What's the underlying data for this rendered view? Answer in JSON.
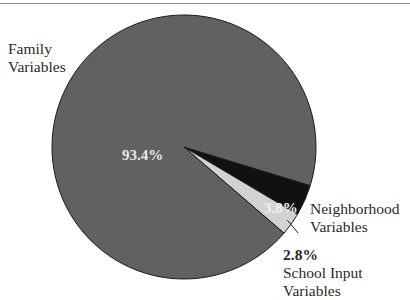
{
  "chart_data": {
    "type": "pie",
    "title": "",
    "categories": [
      "Family Variables",
      "Neighborhood Variables",
      "School Input Variables"
    ],
    "values": [
      93.4,
      3.8,
      2.8
    ],
    "unit": "%",
    "colors": [
      "#616161",
      "#111111",
      "#d2d2d2"
    ],
    "labels": {
      "family_name": "Family",
      "family_name2": "Variables",
      "family_pct": "93.4%",
      "neighborhood_name": "Neighborhood",
      "neighborhood_name2": "Variables",
      "neighborhood_pct": "3.8%",
      "school_pct": "2.8%",
      "school_name": "School Input",
      "school_name2": "Variables"
    },
    "legend": "none (direct labels)"
  }
}
